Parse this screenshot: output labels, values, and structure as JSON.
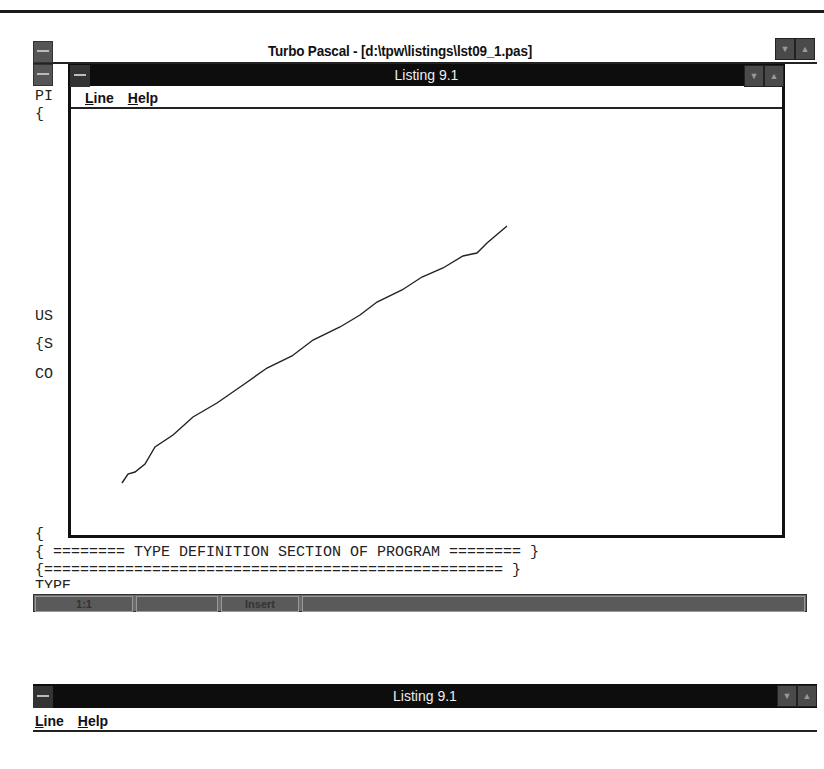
{
  "main_window": {
    "title": "Turbo Pascal - [d:\\tpw\\listings\\lst09_1.pas]",
    "code_lines": [
      {
        "text": "PI",
        "top": 24
      },
      {
        "text": "{",
        "top": 42
      },
      {
        "text": "US",
        "top": 244
      },
      {
        "text": "{S",
        "top": 272
      },
      {
        "text": "CO",
        "top": 302
      },
      {
        "text": "{",
        "top": 462
      },
      {
        "text": "{ ======== TYPE DEFINITION SECTION OF PROGRAM ======== }",
        "top": 480
      },
      {
        "text": "{=================================================== }",
        "top": 498
      },
      {
        "text": "TYPE",
        "top": 514
      }
    ],
    "status": {
      "position": "1:1",
      "modified": "",
      "mode": "Insert",
      "message": ""
    }
  },
  "child_window": {
    "title": "Listing 9.1",
    "menu": [
      {
        "label": "Line",
        "accel": "L",
        "rest": "ine"
      },
      {
        "label": "Help",
        "accel": "H",
        "rest": "elp"
      }
    ],
    "line_color": "#222222",
    "line_points": [
      [
        122,
        483
      ],
      [
        128,
        474
      ],
      [
        135,
        472
      ],
      [
        145,
        464
      ],
      [
        155,
        447
      ],
      [
        173,
        435
      ],
      [
        193,
        417
      ],
      [
        217,
        403
      ],
      [
        243,
        385
      ],
      [
        267,
        368
      ],
      [
        292,
        356
      ],
      [
        313,
        340
      ],
      [
        340,
        327
      ],
      [
        360,
        315
      ],
      [
        377,
        302
      ],
      [
        402,
        290
      ],
      [
        422,
        277
      ],
      [
        443,
        268
      ],
      [
        463,
        256
      ],
      [
        477,
        253
      ],
      [
        487,
        243
      ],
      [
        507,
        226
      ]
    ]
  },
  "bottom_window": {
    "title": "Listing 9.1",
    "menu": [
      {
        "label": "Line",
        "accel": "L",
        "rest": "ine"
      },
      {
        "label": "Help",
        "accel": "H",
        "rest": "elp"
      }
    ]
  }
}
